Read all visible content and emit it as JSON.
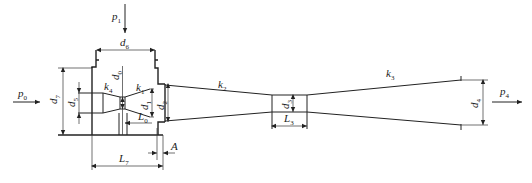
{
  "diagram": {
    "type": "jet-pump / ejector schematic",
    "labels": {
      "p0": {
        "base": "p",
        "sub": "0"
      },
      "p1": {
        "base": "p",
        "sub": "1"
      },
      "p4": {
        "base": "p",
        "sub": "4"
      },
      "d0": {
        "base": "d",
        "sub": "0"
      },
      "d1": {
        "base": "d",
        "sub": "1"
      },
      "d2": {
        "base": "d",
        "sub": "2"
      },
      "d3": {
        "base": "d",
        "sub": "3"
      },
      "d4": {
        "base": "d",
        "sub": "4"
      },
      "d5": {
        "base": "d",
        "sub": "5"
      },
      "d6": {
        "base": "d",
        "sub": "6"
      },
      "d7": {
        "base": "d",
        "sub": "7"
      },
      "k1": {
        "base": "k",
        "sub": "1"
      },
      "k2": {
        "base": "k",
        "sub": "2"
      },
      "k3": {
        "base": "k",
        "sub": "3"
      },
      "k4": {
        "base": "k",
        "sub": "4"
      },
      "L0": {
        "base": "L",
        "sub": "0"
      },
      "L3": {
        "base": "L",
        "sub": "3"
      },
      "L7": {
        "base": "L",
        "sub": "7"
      },
      "A": {
        "base": "A",
        "sub": ""
      }
    },
    "flows": [
      {
        "name": "primary-inlet",
        "label": "p0",
        "direction": "right"
      },
      {
        "name": "suction-inlet",
        "label": "p1",
        "direction": "down"
      },
      {
        "name": "outlet",
        "label": "p4",
        "direction": "right"
      }
    ],
    "sections": [
      {
        "name": "nozzle-inlet",
        "dimension": "d5"
      },
      {
        "name": "nozzle-converging",
        "taper": "k4"
      },
      {
        "name": "nozzle-throat",
        "dimension": "d0"
      },
      {
        "name": "nozzle-diverging",
        "taper": "k1",
        "exit_dimension": "d1"
      },
      {
        "name": "suction-chamber",
        "dimensions": [
          "d6",
          "d7",
          "L7"
        ]
      },
      {
        "name": "mixing-inlet",
        "dimension": "d2",
        "taper": "k2"
      },
      {
        "name": "mixing-throat",
        "dimensions": [
          "d3",
          "L3"
        ]
      },
      {
        "name": "diffuser",
        "taper": "k3",
        "exit_dimension": "d4"
      }
    ]
  }
}
